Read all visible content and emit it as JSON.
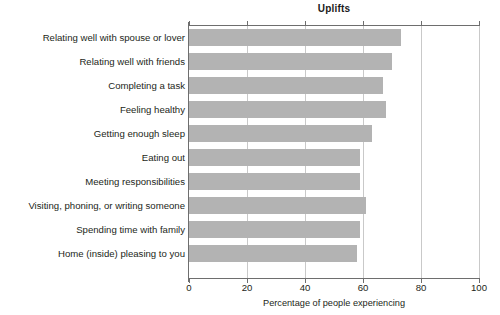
{
  "chart_data": {
    "type": "bar",
    "orientation": "horizontal",
    "title": "Uplifts",
    "xlabel": "Percentage of people experiencing",
    "ylabel": "",
    "xlim": [
      0,
      100
    ],
    "xticks": [
      0,
      20,
      40,
      60,
      80,
      100
    ],
    "xtick_labels": [
      "0",
      "20",
      "40",
      "60",
      "80",
      "100"
    ],
    "grid": true,
    "grid_axis": "x",
    "legend": false,
    "bar_color": "#b3b3b3",
    "axis_color": "#6e6e6e",
    "grid_color": "#c9c9c9",
    "categories": [
      "Relating well with spouse or lover",
      "Relating well with friends",
      "Completing a task",
      "Feeling healthy",
      "Getting enough sleep",
      "Eating out",
      "Meeting responsibilities",
      "Visiting, phoning, or writing someone",
      "Spending time with family",
      "Home (inside) pleasing to you"
    ],
    "values": [
      73,
      70,
      67,
      68,
      63,
      59,
      59,
      61,
      59,
      58
    ]
  }
}
